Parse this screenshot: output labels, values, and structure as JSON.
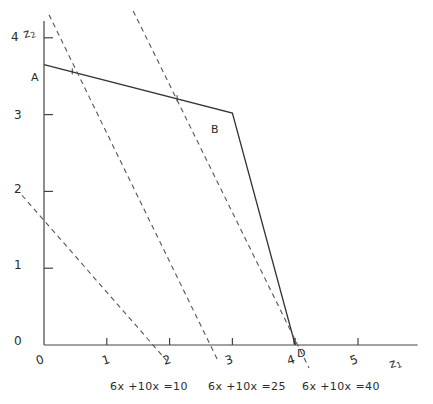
{
  "figure": {
    "axis_labels": {
      "x": "z",
      "x_sub": "1",
      "y": "z",
      "y_sub": "2"
    },
    "point_labels": [
      {
        "name": "A",
        "text": "A",
        "x": 0.0,
        "y": 3.65
      },
      {
        "name": "B",
        "text": "B",
        "x": 3.0,
        "y": 3.02
      },
      {
        "name": "D",
        "text": "D",
        "x": 4.0,
        "y": 0.0
      }
    ],
    "equation_labels": [
      {
        "text": "6x +10x =10",
        "value": 10
      },
      {
        "text": "6x +10x =25",
        "value": 25
      },
      {
        "text": "6x +10x =40",
        "value": 40
      }
    ],
    "colors": {
      "axis": "#444444",
      "solid_line": "#333333",
      "dashed_line": "#555555",
      "text": "#2b2b2b",
      "background": "#ffffff"
    }
  },
  "chart_data": {
    "type": "line",
    "title": "",
    "xlabel": "z1",
    "ylabel": "z2",
    "xlim": [
      0,
      5.6
    ],
    "ylim": [
      0,
      4.2
    ],
    "xticks": [
      0,
      1,
      2,
      3,
      4,
      5
    ],
    "xticklabels": [
      "0",
      "1",
      "2",
      "3",
      "4",
      "5"
    ],
    "yticks": [
      0,
      1,
      2,
      3,
      4
    ],
    "yticklabels": [
      "0",
      "1",
      "2",
      "3",
      "4"
    ],
    "grid": false,
    "legend": "none",
    "series": [
      {
        "name": "feasible-region-boundary",
        "style": "solid",
        "points": [
          {
            "x": 0.0,
            "y": 3.65
          },
          {
            "x": 3.0,
            "y": 3.02
          },
          {
            "x": 4.0,
            "y": 0.0
          }
        ]
      },
      {
        "name": "objective-contour-10",
        "style": "dashed",
        "label": "6x +10x =10",
        "points": [
          {
            "x": -0.35,
            "y": 1.95
          },
          {
            "x": 1.95,
            "y": -0.2
          }
        ]
      },
      {
        "name": "objective-contour-25",
        "style": "dashed",
        "label": "6x +10x =25",
        "points": [
          {
            "x": 0.08,
            "y": 4.3
          },
          {
            "x": 2.78,
            "y": -0.22
          }
        ]
      },
      {
        "name": "objective-contour-40",
        "style": "dashed",
        "label": "6x +10x =40",
        "points": [
          {
            "x": 1.42,
            "y": 4.35
          },
          {
            "x": 4.22,
            "y": -0.3
          }
        ]
      }
    ],
    "annotations": [
      {
        "text": "A",
        "x": 0.0,
        "y": 3.65
      },
      {
        "text": "B",
        "x": 3.0,
        "y": 3.02
      },
      {
        "text": "D",
        "x": 4.0,
        "y": 0.0
      }
    ]
  }
}
